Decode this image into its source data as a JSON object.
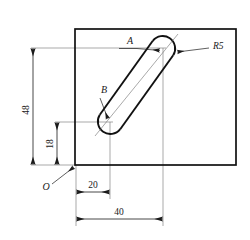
{
  "drawing": {
    "type": "engineering-dimensioned-sketch",
    "title": "Slot feature on rectangular plate",
    "background_color": "#ffffff",
    "line_color": "#1a1a1a",
    "thin_line_color": "#4d4d4d",
    "outline_color": "#111111"
  },
  "labels": {
    "point_a": "A",
    "point_b": "B",
    "origin": "O",
    "radius": "R5"
  },
  "dimensions": [
    {
      "name": "height-overall",
      "value": "48",
      "orientation": "vertical"
    },
    {
      "name": "height-to-b",
      "value": "18",
      "orientation": "vertical"
    },
    {
      "name": "offset-to-b",
      "value": "20",
      "orientation": "horizontal"
    },
    {
      "name": "offset-to-a",
      "value": "40",
      "orientation": "horizontal"
    }
  ],
  "geometry": {
    "plate": {
      "x": 75,
      "y": 29,
      "width": 161,
      "height": 136
    },
    "slot_end_a": {
      "cx": 163,
      "cy": 48,
      "r": 12.5
    },
    "slot_end_b": {
      "cx": 110,
      "cy": 122,
      "r": 12.5
    },
    "origin_point": {
      "x": 76,
      "y": 165
    }
  }
}
